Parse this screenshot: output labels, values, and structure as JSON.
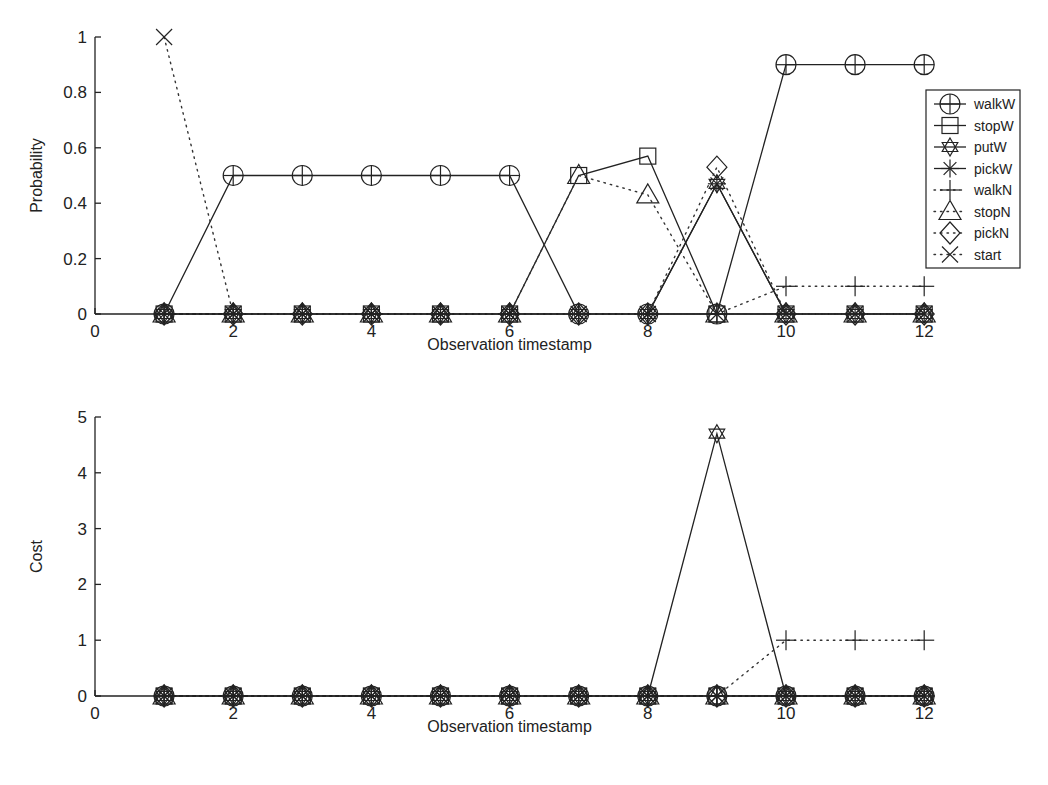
{
  "chart_data": [
    {
      "type": "line",
      "title": "",
      "xlabel": "Observation timestamp",
      "ylabel": "Probability",
      "xlim": [
        0,
        12
      ],
      "ylim": [
        0,
        1
      ],
      "xticks": [
        0,
        2,
        4,
        6,
        8,
        10,
        12
      ],
      "xtick_labels": [
        "0",
        "2",
        "4",
        "6",
        "8",
        "10",
        "12"
      ],
      "yticks": [
        0,
        0.2,
        0.4,
        0.6,
        0.8,
        1
      ],
      "ytick_labels": [
        "0",
        "0.2",
        "0.4",
        "0.6",
        "0.8",
        "1"
      ],
      "grid": false,
      "legend_position": "upper right",
      "x": [
        1,
        2,
        3,
        4,
        5,
        6,
        7,
        8,
        9,
        10,
        11,
        12
      ],
      "series": [
        {
          "name": "walkW",
          "marker": "circle-plus",
          "line": "solid",
          "values": [
            0,
            0.5,
            0.5,
            0.5,
            0.5,
            0.5,
            0,
            0,
            0,
            0.9,
            0.9,
            0.9
          ]
        },
        {
          "name": "stopW",
          "marker": "square",
          "line": "solid",
          "values": [
            0,
            0,
            0,
            0,
            0,
            0,
            0.5,
            0.57,
            0,
            0,
            0,
            0
          ]
        },
        {
          "name": "putW",
          "marker": "hexagram",
          "line": "solid",
          "values": [
            0,
            0,
            0,
            0,
            0,
            0,
            0,
            0,
            0.47,
            0,
            0,
            0
          ]
        },
        {
          "name": "pickW",
          "marker": "asterisk",
          "line": "solid",
          "values": [
            0,
            0,
            0,
            0,
            0,
            0,
            0,
            0,
            0.47,
            0,
            0,
            0
          ]
        },
        {
          "name": "walkN",
          "marker": "plus",
          "line": "dotted",
          "values": [
            0,
            0,
            0,
            0,
            0,
            0,
            0,
            0,
            0,
            0.1,
            0.1,
            0.1
          ]
        },
        {
          "name": "stopN",
          "marker": "triangle",
          "line": "dotted",
          "values": [
            0,
            0,
            0,
            0,
            0,
            0,
            0.5,
            0.43,
            0,
            0,
            0,
            0
          ]
        },
        {
          "name": "pickN",
          "marker": "diamond",
          "line": "dotted",
          "values": [
            0,
            0,
            0,
            0,
            0,
            0,
            0,
            0,
            0.53,
            0,
            0,
            0
          ]
        },
        {
          "name": "start",
          "marker": "x",
          "line": "dotted",
          "values": [
            1,
            0,
            0,
            0,
            0,
            0,
            0,
            0,
            0,
            0,
            0,
            0
          ]
        }
      ]
    },
    {
      "type": "line",
      "title": "",
      "xlabel": "Observation timestamp",
      "ylabel": "Cost",
      "xlim": [
        0,
        12
      ],
      "ylim": [
        0,
        5
      ],
      "xticks": [
        0,
        2,
        4,
        6,
        8,
        10,
        12
      ],
      "xtick_labels": [
        "0",
        "2",
        "4",
        "6",
        "8",
        "10",
        "12"
      ],
      "yticks": [
        0,
        1,
        2,
        3,
        4,
        5
      ],
      "ytick_labels": [
        "0",
        "1",
        "2",
        "3",
        "4",
        "5"
      ],
      "grid": false,
      "legend_position": "none",
      "x": [
        1,
        2,
        3,
        4,
        5,
        6,
        7,
        8,
        9,
        10,
        11,
        12
      ],
      "series": [
        {
          "name": "walkW",
          "marker": "circle-plus",
          "line": "solid",
          "values": [
            0,
            0,
            0,
            0,
            0,
            0,
            0,
            0,
            0,
            0,
            0,
            0
          ]
        },
        {
          "name": "stopW",
          "marker": "square",
          "line": "solid",
          "values": [
            0,
            0,
            0,
            0,
            0,
            0,
            0,
            0,
            0,
            0,
            0,
            0
          ]
        },
        {
          "name": "putW",
          "marker": "hexagram",
          "line": "solid",
          "values": [
            0,
            0,
            0,
            0,
            0,
            0,
            0,
            0,
            4.7,
            0,
            0,
            0
          ]
        },
        {
          "name": "pickW",
          "marker": "asterisk",
          "line": "solid",
          "values": [
            0,
            0,
            0,
            0,
            0,
            0,
            0,
            0,
            0,
            0,
            0,
            0
          ]
        },
        {
          "name": "walkN",
          "marker": "plus",
          "line": "dotted",
          "values": [
            0,
            0,
            0,
            0,
            0,
            0,
            0,
            0,
            0,
            1,
            1,
            1
          ]
        },
        {
          "name": "stopN",
          "marker": "triangle",
          "line": "dotted",
          "values": [
            0,
            0,
            0,
            0,
            0,
            0,
            0,
            0,
            0,
            0,
            0,
            0
          ]
        },
        {
          "name": "pickN",
          "marker": "diamond",
          "line": "dotted",
          "values": [
            0,
            0,
            0,
            0,
            0,
            0,
            0,
            0,
            0,
            0,
            0,
            0
          ]
        },
        {
          "name": "start",
          "marker": "x",
          "line": "dotted",
          "values": [
            0,
            0,
            0,
            0,
            0,
            0,
            0,
            0,
            0,
            0,
            0,
            0
          ]
        }
      ]
    }
  ],
  "layout": {
    "plots": [
      {
        "x0": 95,
        "x_per_unit": 69.1,
        "y0": 314,
        "y_top": 37
      },
      {
        "x0": 95,
        "x_per_unit": 69.1,
        "y0": 696,
        "y_top": 417
      }
    ],
    "legend": {
      "x": 926,
      "y": 90,
      "w": 94,
      "h": 178,
      "row_h": 21.5
    }
  }
}
